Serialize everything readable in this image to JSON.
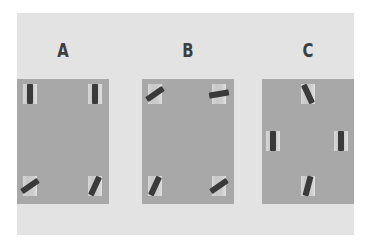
{
  "figure": {
    "background_color": "#e3e3e3",
    "panel_color": "#a8a8a8",
    "bar_color": "#3a3a3a",
    "panels": [
      {
        "label": "A",
        "elements": [
          {
            "position": "top-left",
            "rotation_deg": 0
          },
          {
            "position": "top-right",
            "rotation_deg": 0
          },
          {
            "position": "bottom-left",
            "rotation_deg": 55
          },
          {
            "position": "bottom-right",
            "rotation_deg": 25
          }
        ]
      },
      {
        "label": "B",
        "elements": [
          {
            "position": "top-left",
            "rotation_deg": 55
          },
          {
            "position": "top-right",
            "rotation_deg": 80
          },
          {
            "position": "bottom-left",
            "rotation_deg": 25
          },
          {
            "position": "bottom-right",
            "rotation_deg": 55
          }
        ]
      },
      {
        "label": "C",
        "elements": [
          {
            "position": "top-center",
            "rotation_deg": -25
          },
          {
            "position": "middle-left",
            "rotation_deg": 0
          },
          {
            "position": "middle-right",
            "rotation_deg": 0
          },
          {
            "position": "bottom-center",
            "rotation_deg": 15
          }
        ]
      }
    ]
  }
}
